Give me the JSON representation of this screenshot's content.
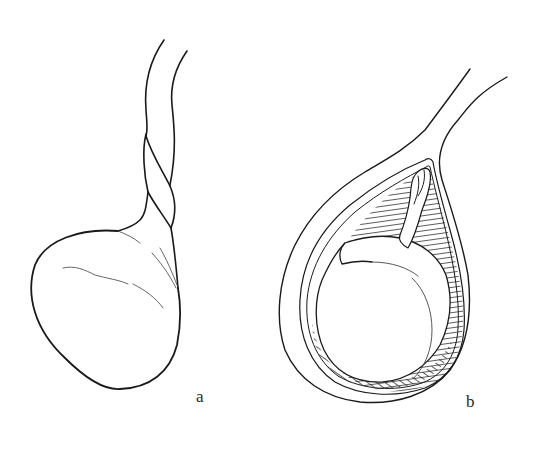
{
  "figure": {
    "panels": [
      {
        "id": "a",
        "label": "a",
        "depicts": "testis with twisted spermatic cord (external view)"
      },
      {
        "id": "b",
        "label": "b",
        "depicts": "testis inside opened tunica vaginalis with hatched cavity (sectional view)"
      }
    ],
    "colors": {
      "line": "#1a1a1a",
      "background": "#ffffff"
    }
  }
}
